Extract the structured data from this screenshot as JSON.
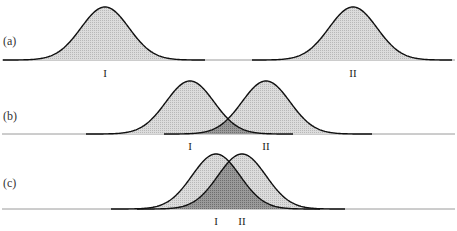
{
  "figure": {
    "colors": {
      "background": "#ffffff",
      "curve_fill": "#d4d4d4",
      "overlap_fill": "#8e8e8e",
      "curve_stroke": "#111111",
      "baseline": "#9a9a9a"
    },
    "panels": [
      {
        "id": "a",
        "label": "(a)",
        "baseline_y": 60,
        "peak_height": 53,
        "sigma": 24,
        "curves": [
          {
            "name": "I",
            "label": "I",
            "mean_x": 105,
            "x_min": 3,
            "x_max": 205
          },
          {
            "name": "II",
            "label": "II",
            "mean_x": 353,
            "x_min": 252,
            "x_max": 452
          }
        ],
        "label_y": 77
      },
      {
        "id": "b",
        "label": "(b)",
        "baseline_y": 134,
        "peak_height": 53,
        "sigma": 24,
        "curves": [
          {
            "name": "I",
            "label": "I",
            "mean_x": 190,
            "x_min": 86,
            "x_max": 293
          },
          {
            "name": "II",
            "label": "II",
            "mean_x": 266,
            "x_min": 164,
            "x_max": 372
          }
        ],
        "label_y": 150
      },
      {
        "id": "c",
        "label": "(c)",
        "baseline_y": 209,
        "peak_height": 55,
        "sigma": 24,
        "curves": [
          {
            "name": "I",
            "label": "I",
            "mean_x": 216,
            "x_min": 111,
            "x_max": 320
          },
          {
            "name": "II",
            "label": "II",
            "mean_x": 242,
            "x_min": 137,
            "x_max": 345
          }
        ],
        "label_y": 225
      }
    ]
  }
}
